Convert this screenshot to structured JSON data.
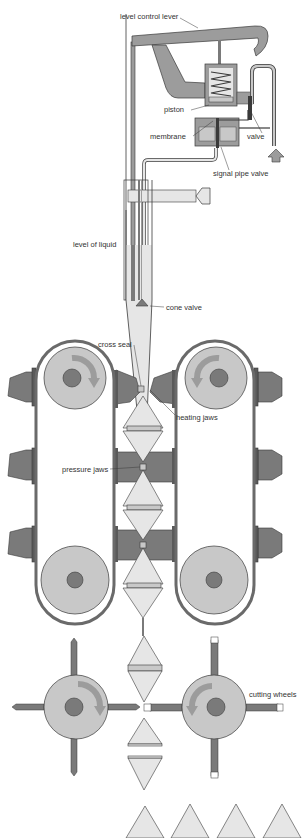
{
  "diagram": {
    "type": "technical-illustration",
    "labels": {
      "level_control_lever": "level control lever",
      "piston": "piston",
      "membrane": "membrane",
      "valve": "valve",
      "signal_pipe_valve": "signal pipe valve",
      "level_of_liquid": "level of liquid",
      "cone_valve": "cone valve",
      "cross_seal": "cross seal",
      "heating_jaws": "heating jaws",
      "pressure_jaws": "pressure jaws",
      "cutting_wheels": "cutting wheels"
    },
    "components": [
      "level-control-lever",
      "spring-piston-box",
      "membrane-valve",
      "signal-pipe",
      "liquid-fill-tube",
      "cone-valve",
      "left-belt-conveyor",
      "right-belt-conveyor",
      "heating-jaws",
      "pressure-jaws",
      "cutting-wheels",
      "sealed-tetrahedral-packages"
    ],
    "colors": {
      "dark_gray": "#7a7a7a",
      "mid_gray": "#9c9c9c",
      "light_gray": "#c8c8c8",
      "fill_light": "#e6e6e6",
      "outline": "#3a3a3a",
      "background": "#ffffff"
    }
  }
}
